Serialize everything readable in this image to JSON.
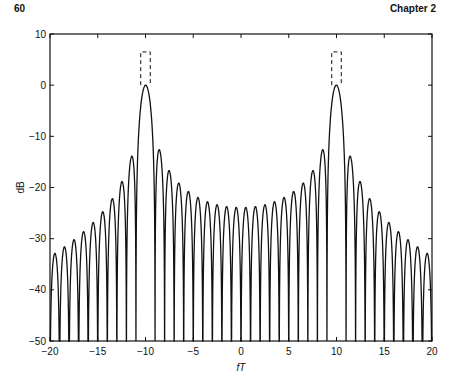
{
  "page": {
    "page_number": "60",
    "chapter": "Chapter 2"
  },
  "chart_data": {
    "type": "line",
    "title": "",
    "xlabel": "fT",
    "ylabel": "dB",
    "xlim": [
      -20,
      20
    ],
    "ylim": [
      -50,
      10
    ],
    "xticks": [
      -20,
      -15,
      -10,
      -5,
      0,
      5,
      10,
      15,
      20
    ],
    "xtick_labels": [
      "−20",
      "−15",
      "−10",
      "−5",
      "0",
      "5",
      "10",
      "15",
      "20"
    ],
    "yticks": [
      10,
      0,
      -10,
      -20,
      -30,
      -40,
      -50
    ],
    "ytick_labels": [
      "10",
      "0",
      "−10",
      "−20",
      "−30",
      "−40",
      "−50"
    ],
    "grid": false,
    "legend": null,
    "series": [
      {
        "name": "spectrum",
        "description": "Magnitude spectrum in dB: sinc-shaped lobes centered at fT = ±10, peak 0 dB, nulls at integer fT",
        "function": "20*log10(|sinc(fT-10) - sinc(fT+10)| / max)",
        "main_lobe_centers": [
          -10,
          10
        ],
        "main_lobe_peak_db": 0,
        "first_sidelobe_db": -13.3,
        "outer_edge_sidelobe_db": -26,
        "inner_sidelobe_near_zero_db": -49,
        "style": "solid",
        "color": "#111111"
      }
    ],
    "annotations": [
      {
        "type": "dashed-rect",
        "x0": -10.5,
        "x1": -9.5,
        "y0": 0,
        "y1": 6.5,
        "open_bottom": true
      },
      {
        "type": "dashed-rect",
        "x0": 9.5,
        "x1": 10.5,
        "y0": 0,
        "y1": 6.5,
        "open_bottom": true
      }
    ]
  }
}
